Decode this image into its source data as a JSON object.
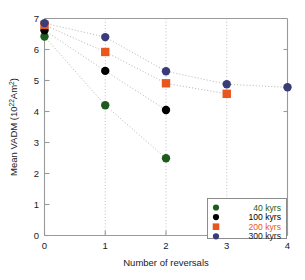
{
  "chart_data": {
    "type": "scatter",
    "title": "",
    "xlabel": "Number of reversals",
    "ylabel": "Mean VADM (10²²Am²)",
    "ylabel_parts": {
      "pre": "Mean VADM (10",
      "sup1": "22",
      "mid": "Am",
      "sup2": "2",
      "post": ")"
    },
    "x": [
      0,
      1,
      2,
      3,
      4
    ],
    "xlim": [
      0,
      4
    ],
    "ylim": [
      0,
      7
    ],
    "xticks": [
      "0",
      "1",
      "2",
      "3",
      "4"
    ],
    "yticks": [
      "0",
      "1",
      "2",
      "3",
      "4",
      "5",
      "6",
      "7"
    ],
    "grid": "vertical-dotted",
    "legend_position": "lower-right",
    "trendlines": "dotted-gray",
    "series": [
      {
        "name": "40 kyrs",
        "label": "40 kyrs",
        "color": "#1d5c1d",
        "text_color": "#1d5c1d",
        "marker": "circle",
        "x": [
          0,
          1,
          2
        ],
        "values": [
          6.42,
          4.2,
          2.49
        ]
      },
      {
        "name": "100 kyrs",
        "label": "100 kyrs",
        "color": "#000000",
        "text_color": "#000000",
        "marker": "circle",
        "x": [
          0,
          1,
          2
        ],
        "values": [
          6.62,
          5.31,
          4.05
        ]
      },
      {
        "name": "200 kyrs",
        "label": "200 kyrs",
        "color": "#e8561e",
        "text_color": "#e8561e",
        "marker": "square",
        "x": [
          0,
          1,
          2,
          3
        ],
        "values": [
          6.79,
          5.92,
          4.91,
          4.57
        ]
      },
      {
        "name": "300 kyrs",
        "label": "300 kyrs",
        "color": "#3b3b7a",
        "text_color": "#1a1a1a",
        "marker": "circle",
        "x": [
          0,
          1,
          2,
          3,
          4
        ],
        "values": [
          6.85,
          6.4,
          5.3,
          4.88,
          4.78
        ]
      }
    ]
  },
  "legend": {
    "entries": [
      {
        "label": "40 kyrs"
      },
      {
        "label": "100 kyrs"
      },
      {
        "label": "200 kyrs"
      },
      {
        "label": "300 kyrs"
      }
    ]
  }
}
